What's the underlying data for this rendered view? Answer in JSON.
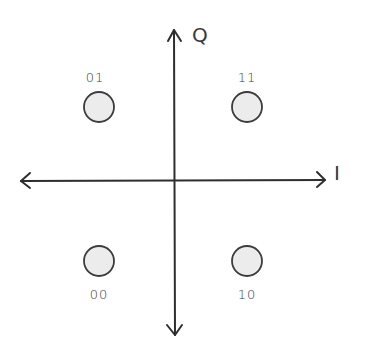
{
  "diagram": {
    "axes": {
      "horizontal": {
        "label": "I",
        "bidirectional": true
      },
      "vertical": {
        "label": "Q",
        "bidirectional": true
      }
    },
    "points": [
      {
        "bits": "01",
        "i": -1,
        "q": 1,
        "label_position": "above"
      },
      {
        "bits": "11",
        "i": 1,
        "q": 1,
        "label_position": "above"
      },
      {
        "bits": "00",
        "i": -1,
        "q": -1,
        "label_position": "below"
      },
      {
        "bits": "10",
        "i": 1,
        "q": -1,
        "label_position": "below"
      }
    ],
    "colors": {
      "stroke": "#2e2e2e",
      "point_fill": "#ececec",
      "background": "#ffffff"
    }
  }
}
